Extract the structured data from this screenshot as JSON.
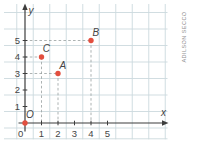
{
  "figure": {
    "caption_credit": "ADILSON SECCO"
  },
  "chart_data": {
    "type": "scatter",
    "title": "",
    "xlabel": "x",
    "ylabel": "y",
    "origin_label": "O",
    "x_ticks": [
      0,
      1,
      2,
      3,
      4,
      5
    ],
    "y_ticks": [
      1,
      2,
      3,
      4,
      5
    ],
    "xlim": [
      0,
      8.5
    ],
    "ylim": [
      0,
      7.2
    ],
    "grid": true,
    "legend": false,
    "points": [
      {
        "label": "O",
        "x": 0,
        "y": 0,
        "guides": false
      },
      {
        "label": "C",
        "x": 1,
        "y": 4,
        "guides": true
      },
      {
        "label": "A",
        "x": 2,
        "y": 3,
        "guides": true
      },
      {
        "label": "B",
        "x": 4,
        "y": 5,
        "guides": true
      }
    ],
    "colors": {
      "point": "#e34f3f",
      "grid": "#ccd9de",
      "axis": "#3d3d3d",
      "dashed": "#98a0a0",
      "label": "#454545",
      "credit": "#8f8f8f",
      "background": "#ffffff"
    }
  }
}
